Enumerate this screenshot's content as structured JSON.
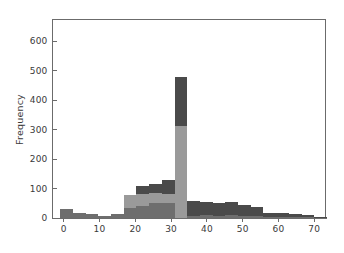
{
  "chart_data": {
    "type": "bar",
    "subtype": "stacked-histogram",
    "title": "",
    "xlabel": "",
    "ylabel": "Frequency",
    "xlim": [
      -3.0,
      73.0
    ],
    "ylim": [
      0,
      672
    ],
    "grid": false,
    "legend": null,
    "bin_width": 3.55,
    "xticks": [
      0,
      10,
      20,
      30,
      40,
      50,
      60,
      70
    ],
    "xtick_labels": [
      "0",
      "10",
      "20",
      "30",
      "40",
      "50",
      "60",
      "70"
    ],
    "yticks": [
      0,
      100,
      200,
      300,
      400,
      500,
      600
    ],
    "ytick_labels": [
      "0",
      "100",
      "200",
      "300",
      "400",
      "500",
      "600"
    ],
    "colors": {
      "series_dark": "#4a4a4a",
      "series_mid": "#6e6e6e",
      "series_light": "#9a9a9a",
      "axis": "#6b6b6b",
      "text": "#3a3a3a",
      "background": "#ffffff"
    },
    "bin_starts": [
      -1.0,
      2.55,
      6.1,
      9.65,
      13.2,
      16.75,
      20.3,
      23.85,
      27.4,
      30.95,
      34.5,
      38.05,
      41.6,
      45.15,
      48.7,
      52.25,
      55.8,
      59.35,
      62.9,
      66.45,
      70.0
    ],
    "series": [
      {
        "name": "lower",
        "color": "#6e6e6e",
        "values": [
          32,
          18,
          13,
          8,
          13,
          34,
          42,
          52,
          50,
          0,
          6,
          9,
          8,
          9,
          8,
          6,
          5,
          5,
          3,
          2,
          1
        ]
      },
      {
        "name": "middle",
        "color": "#9a9a9a",
        "values": [
          0,
          0,
          0,
          0,
          0,
          44,
          38,
          33,
          32,
          313,
          0,
          0,
          0,
          0,
          0,
          0,
          0,
          0,
          0,
          0,
          0
        ]
      },
      {
        "name": "upper",
        "color": "#4a4a4a",
        "values": [
          0,
          0,
          0,
          0,
          0,
          0,
          28,
          29,
          48,
          167,
          53,
          44,
          42,
          44,
          35,
          30,
          13,
          13,
          12,
          7,
          2
        ]
      }
    ],
    "totals": [
      32,
      18,
      13,
      8,
      13,
      78,
      108,
      114,
      130,
      650,
      59,
      53,
      50,
      53,
      43,
      36,
      18,
      18,
      15,
      9,
      3
    ],
    "peak": {
      "bin_start": 30.95,
      "bin_end": 34.5,
      "value": 650
    }
  }
}
